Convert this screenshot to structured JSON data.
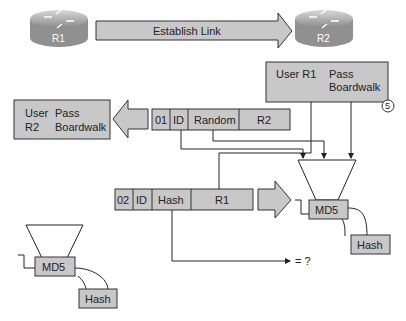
{
  "routers": [
    {
      "label": "R1"
    },
    {
      "label": "R2"
    }
  ],
  "link_arrow": {
    "label": "Establish Link"
  },
  "r1_credentials": {
    "user_label": "User R1",
    "pass_label": "Pass",
    "pass_value": "Boardwalk"
  },
  "r2_credentials": {
    "user_label": "User",
    "user_value": "R2",
    "pass_label": "Pass",
    "pass_value": "Boardwalk"
  },
  "challenge_packet": {
    "fields": [
      "01",
      "ID",
      "Random",
      "R2"
    ]
  },
  "response_packet": {
    "fields": [
      "02",
      "ID",
      "Hash",
      "R1"
    ]
  },
  "md5_right": {
    "label": "MD5",
    "output": "Hash"
  },
  "md5_left": {
    "label": "MD5",
    "output": "Hash"
  },
  "compare_label": "= ?",
  "step_number": "5",
  "colors": {
    "box_fill": "#c8c8c8",
    "stroke": "#333333",
    "router": "#9a9a9a"
  }
}
